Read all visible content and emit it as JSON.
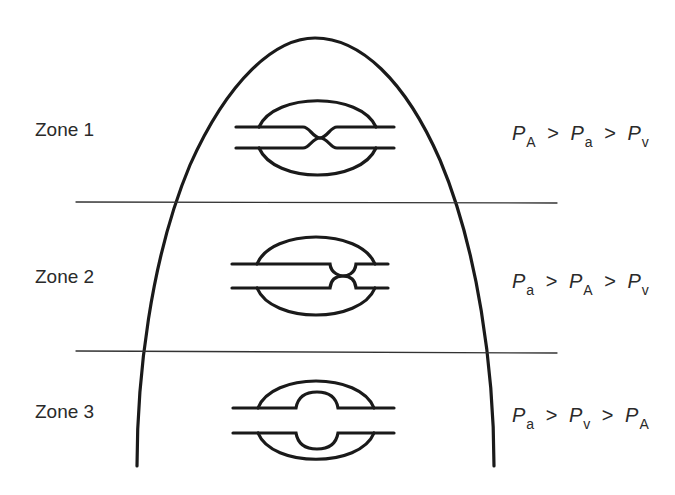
{
  "diagram": {
    "type": "lung-zones",
    "colors": {
      "line": "#1a1a1a",
      "divider": "#333333",
      "background": "#ffffff"
    },
    "zones": [
      {
        "label": "Zone 1",
        "relation": [
          {
            "symbol": "P",
            "sub": "A"
          },
          {
            "op": ">"
          },
          {
            "symbol": "P",
            "sub": "a"
          },
          {
            "op": ">"
          },
          {
            "symbol": "P",
            "sub": "v"
          }
        ],
        "vessel_state": "collapsed"
      },
      {
        "label": "Zone 2",
        "relation": [
          {
            "symbol": "P",
            "sub": "a"
          },
          {
            "op": ">"
          },
          {
            "symbol": "P",
            "sub": "A"
          },
          {
            "op": ">"
          },
          {
            "symbol": "P",
            "sub": "v"
          }
        ],
        "vessel_state": "partially-narrowed"
      },
      {
        "label": "Zone 3",
        "relation": [
          {
            "symbol": "P",
            "sub": "a"
          },
          {
            "op": ">"
          },
          {
            "symbol": "P",
            "sub": "v"
          },
          {
            "op": ">"
          },
          {
            "symbol": "P",
            "sub": "A"
          }
        ],
        "vessel_state": "distended"
      }
    ]
  }
}
